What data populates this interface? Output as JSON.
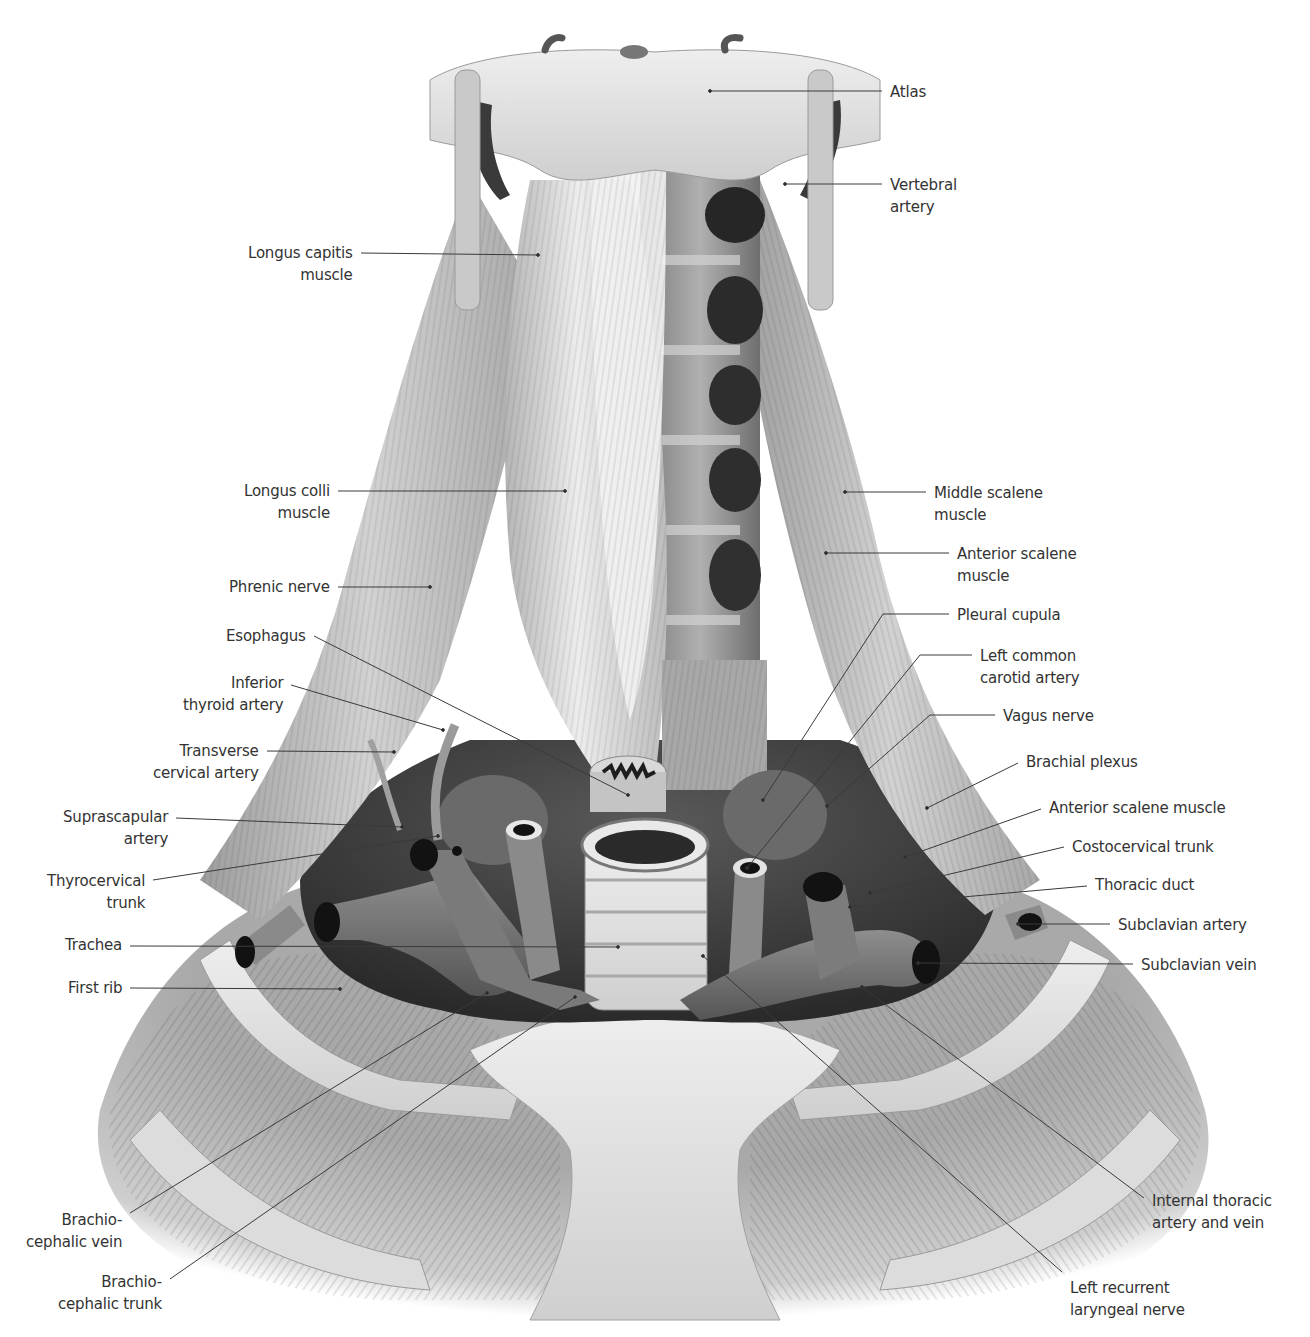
{
  "figure": {
    "style": "grayscale anatomical illustration"
  },
  "labels_left": [
    {
      "id": "longus-capitis",
      "lines": [
        "Longus capitis",
        "muscle"
      ],
      "x": 353,
      "y": 242,
      "anchor": [
        538,
        255
      ],
      "line_y": 253
    },
    {
      "id": "longus-colli",
      "lines": [
        "Longus colli",
        "muscle"
      ],
      "x": 330,
      "y": 480,
      "anchor": [
        565,
        491
      ],
      "line_y": 491
    },
    {
      "id": "phrenic-nerve",
      "lines": [
        "Phrenic nerve"
      ],
      "x": 330,
      "y": 576,
      "anchor": [
        430,
        587
      ],
      "line_y": 587
    },
    {
      "id": "esophagus",
      "lines": [
        "Esophagus"
      ],
      "x": 306,
      "y": 625,
      "anchor": [
        628,
        795
      ],
      "line_y": 636
    },
    {
      "id": "inferior-thyroid-artery",
      "lines": [
        "Inferior",
        "thyroid artery"
      ],
      "x": 283,
      "y": 672,
      "anchor": [
        443,
        730
      ],
      "line_y": 685
    },
    {
      "id": "transverse-cervical-artery",
      "lines": [
        "Transverse",
        "cervical artery"
      ],
      "x": 259,
      "y": 740,
      "anchor": [
        394,
        752
      ],
      "line_y": 751
    },
    {
      "id": "suprascapular-artery",
      "lines": [
        "Suprascapular",
        "artery"
      ],
      "x": 168,
      "y": 806,
      "anchor": [
        402,
        827
      ],
      "line_y": 818
    },
    {
      "id": "thyrocervical-trunk",
      "lines": [
        "Thyrocervical",
        "trunk"
      ],
      "x": 145,
      "y": 870,
      "anchor": [
        438,
        836
      ],
      "line_y": 880
    },
    {
      "id": "trachea",
      "lines": [
        "Trachea"
      ],
      "x": 122,
      "y": 934,
      "anchor": [
        618,
        947
      ],
      "line_y": 946
    },
    {
      "id": "first-rib",
      "lines": [
        "First rib"
      ],
      "x": 122,
      "y": 977,
      "anchor": [
        340,
        989
      ],
      "line_y": 988
    },
    {
      "id": "brachiocephalic-vein",
      "lines": [
        "Brachio-",
        "cephalic vein"
      ],
      "x": 122,
      "y": 1209,
      "anchor": [
        487,
        993
      ],
      "line_y": 1213
    },
    {
      "id": "brachiocephalic-trunk",
      "lines": [
        "Brachio-",
        "cephalic trunk"
      ],
      "x": 162,
      "y": 1271,
      "anchor": [
        575,
        997
      ],
      "line_y": 1279
    }
  ],
  "labels_right": [
    {
      "id": "atlas",
      "lines": [
        "Atlas"
      ],
      "x": 890,
      "y": 81,
      "anchor": [
        710,
        91
      ],
      "line_y": 91
    },
    {
      "id": "vertebral-artery",
      "lines": [
        "Vertebral",
        "artery"
      ],
      "x": 890,
      "y": 174,
      "anchor": [
        785,
        184
      ],
      "line_y": 184
    },
    {
      "id": "middle-scalene-muscle",
      "lines": [
        "Middle scalene",
        "muscle"
      ],
      "x": 934,
      "y": 482,
      "anchor": [
        845,
        492
      ],
      "line_y": 492
    },
    {
      "id": "anterior-scalene-muscle-upper",
      "lines": [
        "Anterior scalene",
        "muscle"
      ],
      "x": 957,
      "y": 543,
      "anchor": [
        826,
        553
      ],
      "line_y": 553
    },
    {
      "id": "pleural-cupula",
      "lines": [
        "Pleural cupula"
      ],
      "x": 957,
      "y": 604,
      "anchor": [
        763,
        800
      ],
      "line_y": 614,
      "elbow": [
        883,
        614
      ]
    },
    {
      "id": "left-common-carotid-artery",
      "lines": [
        "Left common",
        "carotid artery"
      ],
      "x": 980,
      "y": 645,
      "anchor": [
        747,
        868
      ],
      "line_y": 655,
      "elbow": [
        920,
        655
      ]
    },
    {
      "id": "vagus-nerve",
      "lines": [
        "Vagus nerve"
      ],
      "x": 1003,
      "y": 705,
      "anchor": [
        827,
        806
      ],
      "line_y": 715,
      "elbow": [
        930,
        715
      ]
    },
    {
      "id": "brachial-plexus",
      "lines": [
        "Brachial plexus"
      ],
      "x": 1026,
      "y": 751,
      "anchor": [
        927,
        808
      ],
      "line_y": 763
    },
    {
      "id": "anterior-scalene-muscle",
      "lines": [
        "Anterior scalene muscle"
      ],
      "x": 1049,
      "y": 797,
      "anchor": [
        905,
        857
      ],
      "line_y": 809
    },
    {
      "id": "costocervical-trunk",
      "lines": [
        "Costocervical trunk"
      ],
      "x": 1072,
      "y": 836,
      "anchor": [
        870,
        893
      ],
      "line_y": 847
    },
    {
      "id": "thoracic-duct",
      "lines": [
        "Thoracic duct"
      ],
      "x": 1095,
      "y": 874,
      "anchor": [
        850,
        907
      ],
      "line_y": 886
    },
    {
      "id": "subclavian-artery",
      "lines": [
        "Subclavian artery"
      ],
      "x": 1118,
      "y": 914,
      "anchor": [
        1018,
        924
      ],
      "line_y": 924
    },
    {
      "id": "subclavian-vein",
      "lines": [
        "Subclavian vein"
      ],
      "x": 1141,
      "y": 954,
      "anchor": [
        918,
        963
      ],
      "line_y": 964
    },
    {
      "id": "internal-thoracic-artery-vein",
      "lines": [
        "Internal thoracic",
        "artery and vein"
      ],
      "x": 1152,
      "y": 1190,
      "anchor": [
        862,
        987
      ],
      "line_y": 1198
    },
    {
      "id": "left-recurrent-laryngeal-nerve",
      "lines": [
        "Left recurrent",
        "laryngeal nerve"
      ],
      "x": 1070,
      "y": 1277,
      "anchor": [
        703,
        956
      ],
      "line_y": 1272
    }
  ],
  "colors": {
    "background": "#ffffff",
    "label_text": "#333333",
    "leader_line": "#3a3a3a",
    "bone_light": "#e4e4e4",
    "muscle_mid": "#b8b8b8",
    "vessel_dark": "#6e6e6e",
    "cavity": "#1a1a1a"
  }
}
